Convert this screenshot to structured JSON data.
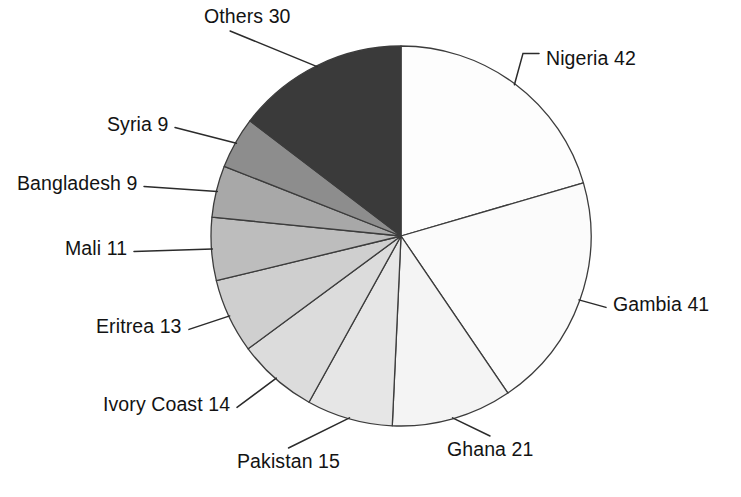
{
  "chart_data": {
    "type": "pie",
    "title": "",
    "subtitle": "",
    "xlabel": "",
    "ylabel": "",
    "legend_position": "none",
    "grid": false,
    "total": 205,
    "start_angle_deg": 0,
    "direction": "clockwise",
    "categories": [
      "Nigeria",
      "Gambia",
      "Ghana",
      "Pakistan",
      "Ivory Coast",
      "Eritrea",
      "Mali",
      "Bangladesh",
      "Syria",
      "Others"
    ],
    "values": [
      42,
      41,
      21,
      15,
      14,
      13,
      11,
      9,
      9,
      30
    ],
    "labels": [
      "Nigeria 42",
      "Gambia 41",
      "Ghana 21",
      "Pakistan 15",
      "Ivory Coast 14",
      "Eritrea 13",
      "Mali 11",
      "Bangladesh 9",
      "Syria 9",
      "Others 30"
    ],
    "slice_colors": [
      "#fdfdfd",
      "#fbfbfb",
      "#f4f4f4",
      "#e6e6e6",
      "#dcdcdc",
      "#cfcfcf",
      "#bdbdbd",
      "#a8a8a8",
      "#8d8d8d",
      "#3a3a3a"
    ],
    "slice_edge_color": "#3c3c3c",
    "leader_line_color": "#2b2b2b",
    "label_text_color": "#131313",
    "background": "#ffffff",
    "geometry": {
      "center_x": 401,
      "center_y": 236,
      "radius": 190
    }
  },
  "labels_layout": [
    {
      "key": "nigeria",
      "text": "Nigeria 42",
      "left": 546,
      "top": 49
    },
    {
      "key": "gambia",
      "text": "Gambia 41",
      "left": 613,
      "top": 295
    },
    {
      "key": "ghana",
      "text": "Ghana 21",
      "left": 447,
      "top": 440
    },
    {
      "key": "pakistan",
      "text": "Pakistan 15",
      "left": 237,
      "top": 452
    },
    {
      "key": "ivory-coast",
      "text": "Ivory Coast 14",
      "left": 103,
      "top": 395
    },
    {
      "key": "eritrea",
      "text": "Eritrea 13",
      "left": 96,
      "top": 317
    },
    {
      "key": "mali",
      "text": "Mali 11",
      "left": 65,
      "top": 239
    },
    {
      "key": "bangladesh",
      "text": "Bangladesh 9",
      "left": 17,
      "top": 174
    },
    {
      "key": "syria",
      "text": "Syria 9",
      "left": 107,
      "top": 115
    },
    {
      "key": "others",
      "text": "Others 30",
      "left": 204,
      "top": 7
    }
  ]
}
